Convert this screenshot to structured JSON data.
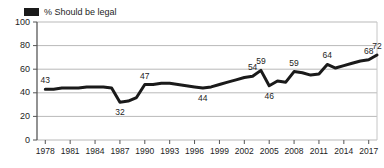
{
  "legend": {
    "swatch_icon": "legend-swatch-black",
    "swatch_color": "#1a1a1a",
    "label": "% Should be legal"
  },
  "axes": {
    "y_ticks": [
      "100",
      "80",
      "60",
      "40",
      "20",
      "0"
    ],
    "x_ticks": [
      "1978",
      "1981",
      "1984",
      "1987",
      "1990",
      "1993",
      "1996",
      "1999",
      "2002",
      "2005",
      "2008",
      "2011",
      "2014",
      "2017"
    ]
  },
  "chart_data": {
    "type": "line",
    "title": "",
    "subtitle": "",
    "xlabel": "",
    "ylabel": "",
    "ylim": [
      0,
      100
    ],
    "xlim": [
      1977,
      2018
    ],
    "grid": true,
    "legend_position": "top-left",
    "line_color": "#1a1a1a",
    "line_width": 3,
    "series": [
      {
        "name": "% Should be legal",
        "x": [
          1978,
          1979,
          1980,
          1981,
          1982,
          1983,
          1984,
          1985,
          1986,
          1987,
          1988,
          1989,
          1990,
          1991,
          1992,
          1993,
          1994,
          1995,
          1996,
          1997,
          1998,
          1999,
          2000,
          2001,
          2002,
          2003,
          2004,
          2005,
          2006,
          2007,
          2008,
          2009,
          2010,
          2011,
          2012,
          2013,
          2014,
          2015,
          2016,
          2017,
          2018
        ],
        "values": [
          43,
          43,
          44,
          44,
          44,
          45,
          45,
          45,
          44,
          32,
          33,
          36,
          47,
          47,
          48,
          48,
          47,
          46,
          45,
          44,
          45,
          47,
          49,
          51,
          53,
          54,
          59,
          46,
          50,
          49,
          58,
          57,
          55,
          56,
          64,
          61,
          63,
          65,
          67,
          68,
          72
        ]
      }
    ],
    "point_labels": [
      {
        "text": "43",
        "year": 1978,
        "value": 43,
        "position": "above"
      },
      {
        "text": "32",
        "year": 1987,
        "value": 32,
        "position": "below"
      },
      {
        "text": "47",
        "year": 1990,
        "value": 47,
        "position": "above"
      },
      {
        "text": "44",
        "year": 1997,
        "value": 44,
        "position": "below"
      },
      {
        "text": "54",
        "year": 2003,
        "value": 54,
        "position": "above"
      },
      {
        "text": "59",
        "year": 2004,
        "value": 59,
        "position": "above"
      },
      {
        "text": "46",
        "year": 2005,
        "value": 46,
        "position": "below"
      },
      {
        "text": "59",
        "year": 2008,
        "value": 58,
        "position": "above"
      },
      {
        "text": "64",
        "year": 2012,
        "value": 64,
        "position": "above"
      },
      {
        "text": "68",
        "year": 2017,
        "value": 68,
        "position": "above"
      },
      {
        "text": "72",
        "year": 2018,
        "value": 72,
        "position": "above"
      }
    ]
  }
}
